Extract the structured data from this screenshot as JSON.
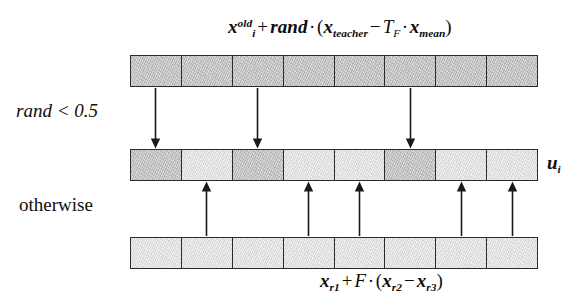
{
  "diagram": {
    "grid": {
      "cell_count": 8,
      "colors": {
        "dark_cell": "#c3c3c3",
        "light_cell": "#e3e3e3",
        "cell_border": "#2b2b2b",
        "arrow": "#1a1a1a",
        "text": "#0d0d0d",
        "background": "#ffffff"
      }
    },
    "rows": [
      {
        "id": "row-top",
        "name": "teacher-mutant-vector-row",
        "shades": [
          "dark",
          "dark",
          "dark",
          "dark",
          "dark",
          "dark",
          "dark",
          "dark"
        ],
        "label_formula": "formula_top"
      },
      {
        "id": "row-middle",
        "name": "trial-vector-row",
        "shades": [
          "dark",
          "light",
          "dark",
          "light",
          "light",
          "dark",
          "light",
          "light"
        ],
        "label_formula": "label_u"
      },
      {
        "id": "row-bottom",
        "name": "de-mutant-vector-row",
        "shades": [
          "light",
          "light",
          "light",
          "light",
          "light",
          "light",
          "light",
          "light"
        ],
        "label_formula": "formula_bottom"
      }
    ],
    "down_arrows": {
      "source_cells": [
        1,
        3,
        6
      ],
      "count": 3
    },
    "up_arrows": {
      "source_cells": [
        2,
        4,
        5,
        7,
        8
      ],
      "count": 5
    },
    "formula_top": {
      "plain_text": "x_i^old + rand · ( x_teacher − T_F · x_mean )",
      "parts": {
        "x": "x",
        "sup_old": "old",
        "sub_i": "i",
        "plus": "+",
        "rand": "rand",
        "cdot1": "·",
        "lparen": "(",
        "x2": "x",
        "sub_teacher": "teacher",
        "minus": "−",
        "T": "T",
        "sub_F": "F",
        "cdot2": "·",
        "x3": "x",
        "sub_mean": "mean",
        "rparen": ")"
      }
    },
    "formula_bottom": {
      "plain_text": "x_r1 + F · ( x_r2 − x_r3 )",
      "parts": {
        "x": "x",
        "sub_r1": "r1",
        "plus": "+",
        "F": "F",
        "cdot": "·",
        "lparen": "(",
        "x2": "x",
        "sub_r2": "r2",
        "minus": "−",
        "x3": "x",
        "sub_r3": "r3",
        "rparen": ")"
      }
    },
    "condition_top": "rand < 0.5",
    "condition_bottom": "otherwise",
    "label_u": {
      "symbol": "u",
      "subscript": "i"
    }
  }
}
